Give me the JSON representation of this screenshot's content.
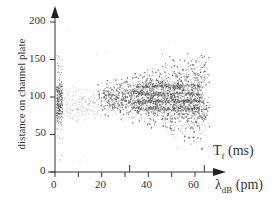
{
  "chart_data": {
    "type": "scatter",
    "title": "",
    "xlabel": "λ_dB (pm)",
    "xlabel_main": "λ",
    "xlabel_sub": "dB",
    "xlabel_unit": "(pm)",
    "x2label": "T_f (ms)",
    "x2label_main": "T",
    "x2label_sub": "f",
    "x2label_unit": "(ms",
    "x2label_close": ")",
    "ylabel": "distance on channel plate",
    "xlim": [
      0,
      70
    ],
    "ylim": [
      0,
      200
    ],
    "xticks": [
      0,
      20,
      40,
      60
    ],
    "xticks_minor": [
      10,
      30,
      50
    ],
    "yticks": [
      0,
      50,
      100,
      150,
      200
    ],
    "x2_tick_positions_lambda": [
      32,
      64
    ],
    "grid": false,
    "legend": null,
    "series": [
      {
        "name": "atom arrivals (dense cloud)",
        "description": "Wedge-shaped cloud of grey points spanning roughly λ 20–65 pm, widening with λ; at λ≈60 spans distance ≈50–160; horizontal darker striping around distance 80–120",
        "x_range": [
          20,
          65
        ],
        "y_center": 100,
        "y_spread_at_x": [
          [
            20,
            20
          ],
          [
            40,
            45
          ],
          [
            60,
            55
          ]
        ]
      },
      {
        "name": "near-zero λ cluster",
        "description": "Narrow vertical cluster at λ≈1–2 with dense spots near distance 85 and 105",
        "x_range": [
          0,
          3
        ],
        "y_range": [
          55,
          130
        ]
      },
      {
        "name": "sparse background",
        "description": "Sparse points between λ 3–20 around distance 90",
        "x_range": [
          3,
          20
        ],
        "y_center": 90
      }
    ]
  },
  "labels": {
    "y_axis": "distance on channel plate",
    "y_ticks": [
      "200",
      "150",
      "100",
      "50",
      "0"
    ],
    "x_ticks": [
      "0",
      "20",
      "40",
      "60"
    ],
    "x_main": "λ",
    "x_sub": "dB",
    "x_unit": "(pm)",
    "x2_main": "T",
    "x2_sub": "f",
    "x2_unit": "(ms)"
  },
  "colors": {
    "axis": "#333333",
    "points": "#7a7a7a",
    "points_dark": "#555555"
  }
}
